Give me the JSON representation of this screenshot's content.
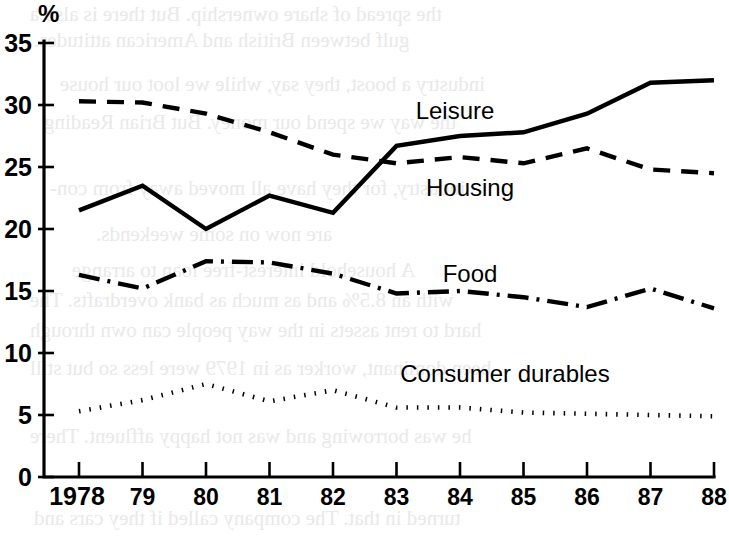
{
  "figure": {
    "unit_label": "%",
    "y_axis": {
      "ticks": [
        "0",
        "5",
        "10",
        "15",
        "20",
        "25",
        "30",
        "35"
      ],
      "min": 0,
      "max": 35
    },
    "x_axis": {
      "ticks": [
        "1978",
        "79",
        "80",
        "81",
        "82",
        "83",
        "84",
        "85",
        "86",
        "87",
        "88"
      ]
    },
    "series_labels": {
      "leisure": "Leisure",
      "housing": "Housing",
      "food": "Food",
      "consumer_durables": "Consumer durables"
    },
    "bleed_text": [
      "the spread of share ownership. But there is also a",
      "gulf between British and American attitudes.",
      "industry a boost, they say, while we loot our house",
      "the way we spend our money. But Brian Reading",
      "industry, for they have all moved away from con-",
      "are now on some weekends.",
      "A household interest-free loan to arrange",
      "with an 8.5% and as much as bank overdrafts. The",
      "hard to rent assets in the way people can own through",
      "been dominant, worker as in 1979 were less so but still",
      "he was borrowing and was not happy affluent. There",
      "turned in that. The company called if they cars and"
    ]
  },
  "chart_data": {
    "type": "line",
    "title": "",
    "xlabel": "",
    "ylabel": "%",
    "ylim": [
      0,
      35
    ],
    "grid": false,
    "legend": "inline-annotations",
    "categories": [
      "1978",
      "79",
      "80",
      "81",
      "82",
      "83",
      "84",
      "85",
      "86",
      "87",
      "88"
    ],
    "series": [
      {
        "name": "Leisure",
        "style": "solid",
        "values": [
          21.5,
          23.5,
          20.0,
          22.7,
          21.3,
          26.7,
          27.5,
          27.8,
          29.3,
          31.8,
          32.0
        ]
      },
      {
        "name": "Housing",
        "style": "dashed",
        "values": [
          30.3,
          30.2,
          29.3,
          27.8,
          26.0,
          25.3,
          25.8,
          25.3,
          26.5,
          24.8,
          24.5
        ]
      },
      {
        "name": "Food",
        "style": "dash-dot",
        "values": [
          16.3,
          15.2,
          17.4,
          17.3,
          16.4,
          14.8,
          15.0,
          14.5,
          13.7,
          15.2,
          13.6
        ]
      },
      {
        "name": "Consumer durables",
        "style": "dotted",
        "values": [
          5.3,
          6.2,
          7.5,
          6.1,
          7.0,
          5.6,
          5.6,
          5.2,
          5.1,
          5.0,
          4.9
        ]
      }
    ]
  }
}
